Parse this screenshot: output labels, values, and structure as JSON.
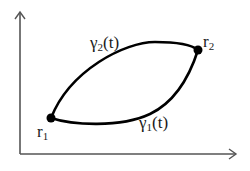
{
  "diagram": {
    "axes": {
      "y_axis": {
        "x": 20,
        "y_top": 12,
        "y_bottom": 154
      },
      "x_axis": {
        "y": 154,
        "x_left": 20,
        "x_right": 236
      },
      "color": "#555555"
    },
    "points": [
      {
        "id": "r1",
        "base": "r",
        "sub": "1",
        "x": 51,
        "y": 118
      },
      {
        "id": "r2",
        "base": "r",
        "sub": "2",
        "x": 198,
        "y": 50
      }
    ],
    "curves": [
      {
        "id": "gamma2",
        "base": "γ",
        "sub": "2",
        "arg": "(t)",
        "position": "upper"
      },
      {
        "id": "gamma1",
        "base": "γ",
        "sub": "1",
        "arg": "(t)",
        "position": "lower"
      }
    ],
    "colors": {
      "curve": "#000000",
      "axis": "#555555",
      "text": "#1a1a1a"
    }
  }
}
